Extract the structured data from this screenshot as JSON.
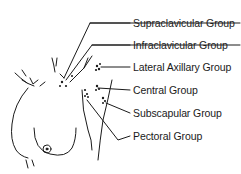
{
  "diagram": {
    "labels": [
      {
        "id": "supraclavicular",
        "text": "Supraclavicular Group",
        "x": 133,
        "y": 11
      },
      {
        "id": "infraclavicular",
        "text": "Infraclavicular Group",
        "x": 133,
        "y": 35
      },
      {
        "id": "lateral-axillary",
        "text": "Lateral Axillary Group",
        "x": 133,
        "y": 59
      },
      {
        "id": "central",
        "text": "Central Group",
        "x": 133,
        "y": 82
      },
      {
        "id": "subscapular",
        "text": "Subscapular Group",
        "x": 133,
        "y": 105
      },
      {
        "id": "pectoral",
        "text": "Pectoral Group",
        "x": 133,
        "y": 128
      }
    ],
    "colors": {
      "line": "#1a1a1a",
      "background": "#ffffff"
    }
  }
}
